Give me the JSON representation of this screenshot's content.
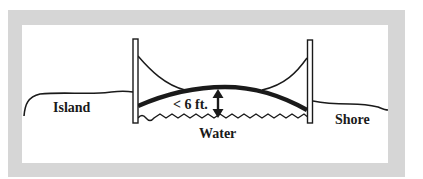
{
  "diagram": {
    "type": "bridge-clearance-illustration",
    "labels": {
      "island": "Island",
      "clearance": "< 6 ft.",
      "water": "Water",
      "shore": "Shore"
    },
    "elements": [
      "left-bridge-tower",
      "right-bridge-tower",
      "suspension-cables",
      "bridge-deck",
      "clearance-arrow",
      "water-surface",
      "island-ground-line",
      "shore-ground-line"
    ]
  },
  "colors": {
    "frame": "#d6d6d6",
    "panel": "#ffffff",
    "ink": "#1a1a1a"
  }
}
